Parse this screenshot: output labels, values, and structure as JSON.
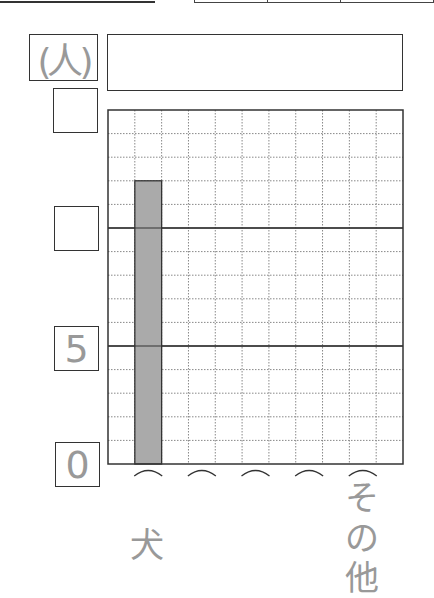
{
  "chart_data": {
    "type": "bar",
    "title": "",
    "unit_label": "(人)",
    "ylabel": "(人)",
    "xlabel": "",
    "ylim": [
      0,
      15
    ],
    "y_major_step": 5,
    "y_minor_step": 1,
    "y_tick_labels": [
      "0",
      "5",
      "",
      ""
    ],
    "categories": [
      "犬",
      "",
      "",
      "",
      "その他"
    ],
    "values": [
      12,
      null,
      null,
      null,
      null
    ],
    "bar_color": "#aaaaaa",
    "grid": true,
    "grid_columns": 11
  },
  "worksheet": {
    "top_rule_visible": true,
    "top_box_cells": 3,
    "title_box_text": ""
  },
  "colors": {
    "ink": "#333333",
    "label_gray": "#999999",
    "grid_dotted": "#888888",
    "bar_fill": "#aaaaaa"
  }
}
